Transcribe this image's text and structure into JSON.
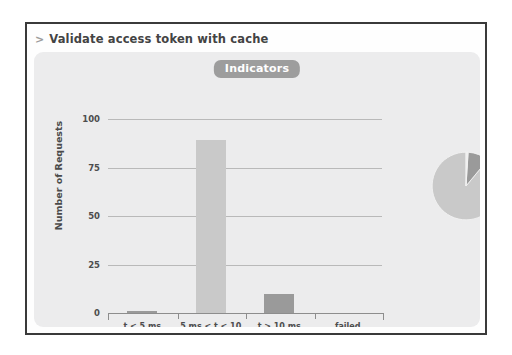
{
  "panel": {
    "title": "Validate access token with cache",
    "title_marker": ">"
  },
  "card": {
    "badge_label": "Indicators"
  },
  "chart_data": {
    "type": "bar",
    "title": "Indicators",
    "xlabel": "",
    "ylabel": "Number of Requests",
    "categories": [
      "t < 5 ms",
      "5 ms < t < 10 ms",
      "t > 10 ms",
      "failed"
    ],
    "values": [
      1,
      89,
      10,
      0
    ],
    "ylim": [
      0,
      100
    ],
    "yticks": [
      0,
      25,
      50,
      75,
      100
    ],
    "ytick_labels": [
      "0",
      "25",
      "50",
      "75",
      "100"
    ],
    "grid": true,
    "legend": "none",
    "bar_colors": [
      "#9a9a9a",
      "#c9c9c9",
      "#9a9a9a",
      "#9a9a9a"
    ],
    "companion_pie": {
      "type": "pie",
      "labels": [
        "5 ms < t < 10 ms",
        "t > 10 ms",
        "t < 5 ms"
      ],
      "values": [
        89,
        10,
        1
      ],
      "colors": [
        "#c9c9c9",
        "#9a9a9a",
        "#eeeeee"
      ]
    }
  },
  "colors": {
    "panel_border": "#3a3a3a",
    "card_background": "#ececed",
    "badge_background": "#9d9d9d",
    "badge_text": "#ffffff",
    "gridline": "#b9b9b9",
    "axis": "#8d8d8d",
    "text": "#4d4d4d",
    "bar_light": "#c9c9c9",
    "bar_dark": "#9a9a9a"
  }
}
